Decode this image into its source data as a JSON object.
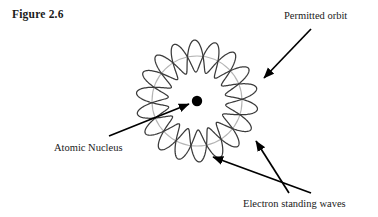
{
  "figure": {
    "caption": "Figure 2.6",
    "background_color": "#ffffff"
  },
  "labels": {
    "permitted_orbit": "Permitted orbit",
    "atomic_nucleus": "Atomic Nucleus",
    "electron_standing_waves": "Electron standing waves"
  },
  "colors": {
    "wave_stroke": "#3b3b3b",
    "orbit_circle_stroke": "#b4b4b4",
    "nucleus_fill": "#000000",
    "arrow_stroke": "#000000",
    "text": "#1a1a1a"
  },
  "diagram": {
    "type": "bohr-de-broglie-standing-wave",
    "center": {
      "x": 197,
      "y": 101
    },
    "nucleus_radius": 5.2,
    "orbit_radius": 45,
    "wave_harmonic_number": 9,
    "wave_amplitude": 16,
    "wave_count": 2,
    "wave_phase_offset_deg": 20,
    "arrows": [
      {
        "name": "permitted-orbit-arrow",
        "from": {
          "x": 311,
          "y": 29
        },
        "to": {
          "x": 264,
          "y": 78
        }
      },
      {
        "name": "atomic-nucleus-arrow",
        "from": {
          "x": 109,
          "y": 136
        },
        "to": {
          "x": 189,
          "y": 104
        }
      },
      {
        "name": "electron-standing-waves-arrow-1",
        "from": {
          "x": 289,
          "y": 193
        },
        "to": {
          "x": 256,
          "y": 141
        }
      },
      {
        "name": "electron-standing-waves-arrow-2",
        "from": {
          "x": 311,
          "y": 193
        },
        "to": {
          "x": 213,
          "y": 157
        }
      }
    ]
  }
}
